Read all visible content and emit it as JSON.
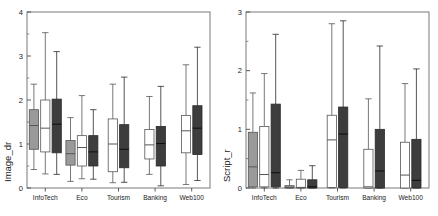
{
  "figure": {
    "background": "#ffffff",
    "panel_count": 2
  },
  "chart_data": [
    {
      "type": "box",
      "panel": "left",
      "title": "",
      "xlabel": "",
      "ylabel": "Image_dr",
      "ylim": [
        0,
        4
      ],
      "yticks": [
        0,
        1,
        2,
        3,
        4
      ],
      "ytick_labels": [
        "0",
        "1",
        "2",
        "3",
        "4"
      ],
      "minor_ticks": true,
      "grid": false,
      "legend": "none",
      "categories": [
        "InfoTech",
        "Eco",
        "Tourism",
        "Banking",
        "Web100"
      ],
      "series_styles": [
        {
          "name": "gray",
          "fill": "#9a9a9a",
          "stroke": "#555555"
        },
        {
          "name": "white",
          "fill": "#ffffff",
          "stroke": "#555555"
        },
        {
          "name": "dark",
          "fill": "#3d3d3d",
          "stroke": "#2a2a2a"
        }
      ],
      "groups": [
        {
          "category": "InfoTech",
          "boxes": [
            {
              "style": "gray",
              "whisker_low": 0.42,
              "q1": 0.88,
              "median": 1.42,
              "q3": 1.78,
              "whisker_high": 2.36
            },
            {
              "style": "white",
              "whisker_low": 0.32,
              "q1": 0.82,
              "median": 1.36,
              "q3": 2.0,
              "whisker_high": 3.53
            },
            {
              "style": "dark",
              "whisker_low": 0.31,
              "q1": 0.8,
              "median": 1.45,
              "q3": 2.02,
              "whisker_high": 3.1
            }
          ]
        },
        {
          "category": "Eco",
          "boxes": [
            {
              "style": "gray",
              "whisker_low": 0.15,
              "q1": 0.52,
              "median": 0.78,
              "q3": 1.08,
              "whisker_high": 1.6
            },
            {
              "style": "white",
              "whisker_low": 0.21,
              "q1": 0.5,
              "median": 0.92,
              "q3": 1.19,
              "whisker_high": 2.1
            },
            {
              "style": "dark",
              "whisker_low": 0.2,
              "q1": 0.5,
              "median": 0.82,
              "q3": 1.19,
              "whisker_high": 1.78
            }
          ]
        },
        {
          "category": "Tourism",
          "boxes": [
            {
              "style": "white",
              "whisker_low": 0.12,
              "q1": 0.37,
              "median": 1.0,
              "q3": 1.57,
              "whisker_high": 2.36
            },
            {
              "style": "dark",
              "whisker_low": 0.13,
              "q1": 0.46,
              "median": 0.88,
              "q3": 1.44,
              "whisker_high": 2.52
            }
          ]
        },
        {
          "category": "Banking",
          "boxes": [
            {
              "style": "white",
              "whisker_low": 0.31,
              "q1": 0.66,
              "median": 0.98,
              "q3": 1.33,
              "whisker_high": 2.08
            },
            {
              "style": "dark",
              "whisker_low": 0.05,
              "q1": 0.5,
              "median": 1.01,
              "q3": 1.4,
              "whisker_high": 2.31
            }
          ]
        },
        {
          "category": "Web100",
          "boxes": [
            {
              "style": "white",
              "whisker_low": 0.08,
              "q1": 0.8,
              "median": 1.3,
              "q3": 1.65,
              "whisker_high": 2.8
            },
            {
              "style": "dark",
              "whisker_low": 0.17,
              "q1": 0.76,
              "median": 1.36,
              "q3": 1.87,
              "whisker_high": 3.2
            }
          ]
        }
      ]
    },
    {
      "type": "box",
      "panel": "right",
      "title": "",
      "xlabel": "",
      "ylabel": "Script_r",
      "ylim": [
        0,
        3
      ],
      "yticks": [
        0,
        1,
        2,
        3
      ],
      "ytick_labels": [
        "0",
        "1",
        "2",
        "3"
      ],
      "minor_ticks": true,
      "grid": false,
      "legend": "none",
      "categories": [
        "InfoTech",
        "Eco",
        "Tourism",
        "Banking",
        "Web100"
      ],
      "series_styles": [
        {
          "name": "gray",
          "fill": "#9a9a9a",
          "stroke": "#555555"
        },
        {
          "name": "white",
          "fill": "#ffffff",
          "stroke": "#555555"
        },
        {
          "name": "dark",
          "fill": "#3d3d3d",
          "stroke": "#2a2a2a"
        }
      ],
      "groups": [
        {
          "category": "InfoTech",
          "boxes": [
            {
              "style": "gray",
              "whisker_low": 0.0,
              "q1": 0.02,
              "median": 0.36,
              "q3": 0.95,
              "whisker_high": 1.62
            },
            {
              "style": "white",
              "whisker_low": 0.0,
              "q1": 0.02,
              "median": 0.23,
              "q3": 1.05,
              "whisker_high": 1.95
            },
            {
              "style": "dark",
              "whisker_low": 0.0,
              "q1": 0.02,
              "median": 0.26,
              "q3": 1.43,
              "whisker_high": 2.62
            }
          ]
        },
        {
          "category": "Eco",
          "boxes": [
            {
              "style": "gray",
              "whisker_low": 0.0,
              "q1": 0.0,
              "median": 0.01,
              "q3": 0.04,
              "whisker_high": 0.14
            },
            {
              "style": "white",
              "whisker_low": 0.0,
              "q1": 0.0,
              "median": 0.01,
              "q3": 0.15,
              "whisker_high": 0.3
            },
            {
              "style": "dark",
              "whisker_low": 0.0,
              "q1": 0.0,
              "median": 0.02,
              "q3": 0.14,
              "whisker_high": 0.38
            }
          ]
        },
        {
          "category": "Tourism",
          "boxes": [
            {
              "style": "white",
              "whisker_low": 0.0,
              "q1": 0.01,
              "median": 0.82,
              "q3": 1.24,
              "whisker_high": 2.8
            },
            {
              "style": "dark",
              "whisker_low": 0.0,
              "q1": 0.01,
              "median": 0.92,
              "q3": 1.38,
              "whisker_high": 2.85
            }
          ]
        },
        {
          "category": "Banking",
          "boxes": [
            {
              "style": "white",
              "whisker_low": 0.0,
              "q1": 0.0,
              "median": 0.02,
              "q3": 0.66,
              "whisker_high": 1.52
            },
            {
              "style": "dark",
              "whisker_low": 0.0,
              "q1": 0.0,
              "median": 0.29,
              "q3": 1.0,
              "whisker_high": 2.42
            }
          ]
        },
        {
          "category": "Web100",
          "boxes": [
            {
              "style": "white",
              "whisker_low": 0.0,
              "q1": 0.0,
              "median": 0.22,
              "q3": 0.78,
              "whisker_high": 1.78
            },
            {
              "style": "dark",
              "whisker_low": 0.0,
              "q1": 0.0,
              "median": 0.13,
              "q3": 0.83,
              "whisker_high": 2.03
            }
          ]
        }
      ]
    }
  ]
}
